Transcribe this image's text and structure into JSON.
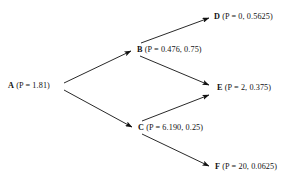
{
  "diagram": {
    "type": "directed-tree",
    "background_color": "#ffffff",
    "stroke_color": "#111111",
    "nodes": [
      {
        "id": "a",
        "key": "A",
        "value": "(P = 1.81)",
        "x": 62,
        "y": 86
      },
      {
        "id": "b",
        "key": "B",
        "value": "(P = 0.476, 0.75)",
        "x": 135,
        "y": 50
      },
      {
        "id": "c",
        "key": "C",
        "value": "(P = 6.190, 0.25)",
        "x": 136,
        "y": 128
      },
      {
        "id": "d",
        "key": "D",
        "value": "(P = 0, 0.5625)",
        "x": 212,
        "y": 17
      },
      {
        "id": "e",
        "key": "E",
        "value": "(P = 2, 0.375)",
        "x": 215,
        "y": 88
      },
      {
        "id": "f",
        "key": "F",
        "value": "(P = 20, 0.0625)",
        "x": 213,
        "y": 167
      }
    ],
    "edges": [
      {
        "id": "a-b",
        "from": "A",
        "to": "B",
        "x1": 64,
        "y1": 83,
        "x2": 131,
        "y2": 51
      },
      {
        "id": "a-c",
        "from": "A",
        "to": "C",
        "x1": 64,
        "y1": 90,
        "x2": 132,
        "y2": 127
      },
      {
        "id": "b-d",
        "from": "B",
        "to": "D",
        "x1": 141,
        "y1": 43,
        "x2": 209,
        "y2": 18
      },
      {
        "id": "b-e",
        "from": "B",
        "to": "E",
        "x1": 140,
        "y1": 56,
        "x2": 209,
        "y2": 85
      },
      {
        "id": "c-e",
        "from": "C",
        "to": "E",
        "x1": 142,
        "y1": 121,
        "x2": 209,
        "y2": 95
      },
      {
        "id": "c-f",
        "from": "C",
        "to": "F",
        "x1": 142,
        "y1": 134,
        "x2": 209,
        "y2": 166
      }
    ]
  }
}
